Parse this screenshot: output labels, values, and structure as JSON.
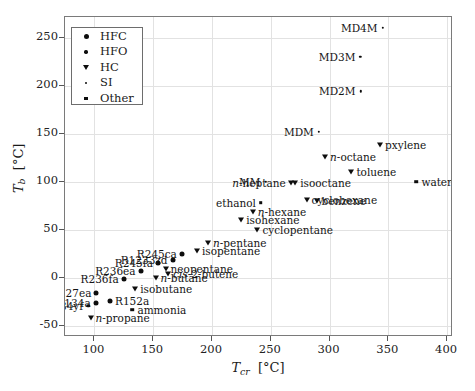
{
  "chart_data": {
    "type": "scatter",
    "title": "",
    "xlabel": "T_cr [°C]",
    "ylabel": "T_b [°C]",
    "xlim": [
      75,
      405
    ],
    "ylim": [
      -62,
      272
    ],
    "xticks": [
      100,
      150,
      200,
      250,
      300,
      350,
      400
    ],
    "yticks": [
      -50,
      0,
      50,
      100,
      150,
      200,
      250
    ],
    "grid": true,
    "legend_position": "upper-left",
    "legend": [
      {
        "label": "HFC",
        "marker": "circle-lg"
      },
      {
        "label": "HFO",
        "marker": "circle-sm"
      },
      {
        "label": "HC",
        "marker": "triangle-down"
      },
      {
        "label": "SI",
        "marker": "dot"
      },
      {
        "label": "Other",
        "marker": "square"
      }
    ],
    "series": [
      {
        "name": "HFC",
        "marker": "circle-lg",
        "points": [
          {
            "label": "R245ca",
            "x": 174.4,
            "y": 25.1,
            "label_side": "left"
          },
          {
            "label": "R245fa",
            "x": 154.0,
            "y": 15.1,
            "label_side": "left"
          },
          {
            "label": "R236ea",
            "x": 139.3,
            "y": 6.5,
            "label_side": "left"
          },
          {
            "label": "R236fa",
            "x": 124.9,
            "y": -1.4,
            "label_side": "left"
          },
          {
            "label": "R227ea",
            "x": 101.7,
            "y": -16.4,
            "label_side": "left"
          },
          {
            "label": "R134a",
            "x": 101.1,
            "y": -26.1,
            "label_side": "left"
          },
          {
            "label": "R152a",
            "x": 113.3,
            "y": -24.0,
            "label_side": "right"
          },
          {
            "label": "R1233zd",
            "x": 166.5,
            "y": 18.3,
            "label_side": "left"
          }
        ]
      },
      {
        "name": "HFO",
        "marker": "circle-sm",
        "points": [
          {
            "label": "R1234yf",
            "x": 94.7,
            "y": -29.5,
            "label_side": "left"
          }
        ]
      },
      {
        "name": "HC",
        "marker": "triangle-down",
        "points": [
          {
            "label": "pxylene",
            "x": 343.0,
            "y": 138.3,
            "label_side": "right"
          },
          {
            "label": "n-octane",
            "x": 296.2,
            "y": 125.6,
            "label_side": "right"
          },
          {
            "label": "toluene",
            "x": 318.6,
            "y": 110.6,
            "label_side": "right"
          },
          {
            "label": "isooctane",
            "x": 270.8,
            "y": 99.2,
            "label_side": "right"
          },
          {
            "label": "cyclohexane",
            "x": 280.5,
            "y": 80.7,
            "label_side": "right"
          },
          {
            "label": "benzene",
            "x": 288.9,
            "y": 80.1,
            "label_side": "right"
          },
          {
            "label": "n-heptane",
            "x": 267.0,
            "y": 98.4,
            "label_side": "left"
          },
          {
            "label": "n-hexane",
            "x": 234.7,
            "y": 68.7,
            "label_side": "right"
          },
          {
            "label": "isohexane",
            "x": 224.9,
            "y": 60.3,
            "label_side": "right"
          },
          {
            "label": "cyclopentane",
            "x": 238.6,
            "y": 49.3,
            "label_side": "right"
          },
          {
            "label": "n-pentane",
            "x": 196.6,
            "y": 36.1,
            "label_side": "right"
          },
          {
            "label": "isopentane",
            "x": 187.2,
            "y": 27.9,
            "label_side": "right"
          },
          {
            "label": "neopentane",
            "x": 160.6,
            "y": 9.5,
            "label_side": "right"
          },
          {
            "label": "cis-2-butene",
            "x": 162.6,
            "y": 3.7,
            "label_side": "right"
          },
          {
            "label": "n-butane",
            "x": 152.0,
            "y": -0.5,
            "label_side": "right"
          },
          {
            "label": "isobutane",
            "x": 134.7,
            "y": -11.7,
            "label_side": "right"
          },
          {
            "label": "n-propane",
            "x": 96.7,
            "y": -42.1,
            "label_side": "right"
          }
        ]
      },
      {
        "name": "SI",
        "marker": "dot",
        "points": [
          {
            "label": "MD4M",
            "x": 345.0,
            "y": 260.4,
            "label_side": "left"
          },
          {
            "label": "MD3M",
            "x": 326.2,
            "y": 230.8,
            "label_side": "left"
          },
          {
            "label": "MD2M",
            "x": 326.3,
            "y": 194.4,
            "label_side": "left"
          },
          {
            "label": "MDM",
            "x": 290.9,
            "y": 152.5,
            "label_side": "left"
          },
          {
            "label": "MM",
            "x": 245.6,
            "y": 100.3,
            "label_side": "left"
          }
        ]
      },
      {
        "name": "Other",
        "marker": "square",
        "points": [
          {
            "label": "water",
            "x": 373.9,
            "y": 100.0,
            "label_side": "right"
          },
          {
            "label": "ethanol",
            "x": 241.6,
            "y": 78.4,
            "label_side": "left"
          },
          {
            "label": "ammonia",
            "x": 132.3,
            "y": -33.3,
            "label_side": "right"
          }
        ]
      }
    ]
  }
}
